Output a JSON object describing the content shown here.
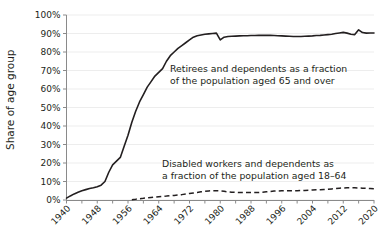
{
  "chart_data": {
    "type": "line",
    "title": "",
    "xlabel": "",
    "ylabel": "Share of age group",
    "xlim": [
      1940,
      2020
    ],
    "ylim": [
      0,
      1.0
    ],
    "grid": true,
    "legend_position": "annotations-inline",
    "y_tick_labels": [
      "0%",
      "10%",
      "20%",
      "30%",
      "40%",
      "50%",
      "60%",
      "70%",
      "80%",
      "90%",
      "100%"
    ],
    "y_tick_values": [
      0,
      10,
      20,
      30,
      40,
      50,
      60,
      70,
      80,
      90,
      100
    ],
    "x_tick_labels": [
      "1940",
      "1948",
      "1956",
      "1964",
      "1972",
      "1980",
      "1988",
      "1996",
      "2004",
      "2012",
      "2020"
    ],
    "x_tick_values": [
      1940,
      1948,
      1956,
      1964,
      1972,
      1980,
      1988,
      1996,
      2004,
      2012,
      2020
    ],
    "x_minor_tick_values": [
      1944,
      1952,
      1960,
      1968,
      1976,
      1984,
      1992,
      2000,
      2008,
      2016
    ],
    "annotations": [
      {
        "name": "retirees-annotation",
        "lines": [
          "Retirees and dependents as a fraction",
          "of the population aged 65 and over"
        ],
        "line1": "Retirees and dependents as a fraction",
        "line2": "of the population aged 65 and over",
        "x": 1964,
        "y": 72
      },
      {
        "name": "disabled-annotation",
        "lines": [
          "Disabled workers and dependents as",
          "a fraction of the population aged 18–64"
        ],
        "line1": "Disabled workers and dependents as",
        "line2": "a fraction of the population aged 18–64",
        "x": 1962,
        "y": 24
      }
    ],
    "series": [
      {
        "name": "Retirees and dependents as a fraction of the population aged 65 and over",
        "style": "solid",
        "color": "#231f20",
        "x": [
          1940,
          1941,
          1942,
          1943,
          1944,
          1945,
          1946,
          1947,
          1948,
          1949,
          1950,
          1951,
          1952,
          1953,
          1954,
          1955,
          1956,
          1957,
          1958,
          1959,
          1960,
          1961,
          1962,
          1963,
          1964,
          1965,
          1966,
          1967,
          1968,
          1969,
          1970,
          1971,
          1972,
          1973,
          1974,
          1975,
          1976,
          1977,
          1978,
          1979,
          1980,
          1981,
          1982,
          1983,
          1984,
          1985,
          1986,
          1987,
          1988,
          1989,
          1990,
          1991,
          1992,
          1993,
          1994,
          1995,
          1996,
          1997,
          1998,
          1999,
          2000,
          2001,
          2002,
          2003,
          2004,
          2005,
          2006,
          2007,
          2008,
          2009,
          2010,
          2011,
          2012,
          2013,
          2014,
          2015,
          2016,
          2017,
          2018,
          2019,
          2020
        ],
        "y": [
          1.0,
          2.2,
          3.3,
          4.2,
          5.0,
          5.6,
          6.2,
          6.6,
          7.2,
          8.0,
          10.0,
          15.0,
          19.0,
          21.0,
          23.0,
          29.0,
          35.0,
          42.0,
          48.0,
          53.0,
          57.0,
          61.0,
          64.0,
          67.0,
          69.0,
          71.0,
          75.0,
          78.0,
          80.0,
          82.0,
          83.5,
          85.0,
          86.5,
          88.0,
          88.8,
          89.2,
          89.6,
          89.8,
          90.0,
          90.2,
          86.5,
          88.0,
          88.4,
          88.5,
          88.6,
          88.7,
          88.8,
          88.8,
          88.9,
          88.9,
          89.0,
          89.0,
          89.0,
          89.0,
          88.9,
          88.8,
          88.7,
          88.6,
          88.5,
          88.4,
          88.4,
          88.4,
          88.5,
          88.6,
          88.7,
          88.9,
          89.0,
          89.2,
          89.4,
          89.6,
          90.0,
          90.3,
          90.6,
          90.2,
          89.6,
          89.4,
          92.0,
          90.5,
          90.2,
          90.3,
          90.3
        ]
      },
      {
        "name": "Disabled workers and dependents as a fraction of the population aged 18–64",
        "style": "dashed",
        "color": "#231f20",
        "x": [
          1957,
          1958,
          1959,
          1960,
          1961,
          1962,
          1963,
          1964,
          1965,
          1966,
          1967,
          1968,
          1969,
          1970,
          1971,
          1972,
          1973,
          1974,
          1975,
          1976,
          1977,
          1978,
          1979,
          1980,
          1981,
          1982,
          1983,
          1984,
          1985,
          1986,
          1987,
          1988,
          1989,
          1990,
          1991,
          1992,
          1993,
          1994,
          1995,
          1996,
          1997,
          1998,
          1999,
          2000,
          2001,
          2002,
          2003,
          2004,
          2005,
          2006,
          2007,
          2008,
          2009,
          2010,
          2011,
          2012,
          2013,
          2014,
          2015,
          2016,
          2017,
          2018,
          2019,
          2020
        ],
        "y": [
          0.2,
          0.4,
          0.7,
          0.9,
          1.2,
          1.4,
          1.6,
          1.8,
          2.0,
          2.1,
          2.3,
          2.5,
          2.7,
          2.9,
          3.2,
          3.5,
          3.8,
          4.1,
          4.4,
          4.7,
          4.9,
          5.0,
          5.0,
          4.9,
          4.7,
          4.4,
          4.2,
          4.1,
          4.0,
          4.0,
          4.0,
          4.0,
          4.0,
          4.1,
          4.2,
          4.4,
          4.6,
          4.8,
          4.9,
          5.0,
          5.0,
          5.0,
          5.0,
          5.0,
          5.1,
          5.2,
          5.3,
          5.4,
          5.5,
          5.6,
          5.7,
          5.8,
          6.0,
          6.2,
          6.4,
          6.5,
          6.6,
          6.6,
          6.6,
          6.5,
          6.4,
          6.3,
          6.2,
          6.1
        ]
      }
    ]
  }
}
